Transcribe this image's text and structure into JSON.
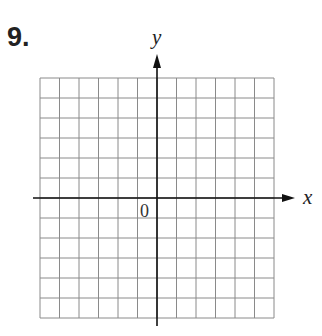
{
  "problem": {
    "number": "9."
  },
  "axes": {
    "x_label": "x",
    "y_label": "y",
    "origin_label": "0"
  },
  "grid": {
    "columns": 12,
    "rows": 12,
    "x_min": -6,
    "x_max": 6,
    "y_min": -6,
    "y_max": 6,
    "line_color": "#8a8a8a",
    "axis_color": "#111111"
  }
}
